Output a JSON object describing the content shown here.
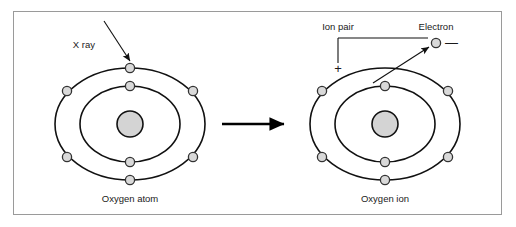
{
  "figure": {
    "border_color": "#9a9a9a",
    "background_color": "#ffffff"
  },
  "labels": {
    "xray": "X ray",
    "ion_pair": "Ion pair",
    "electron": "Electron",
    "plus_sign": "+",
    "minus_sign": "—",
    "caption_left": "Oxygen atom",
    "caption_right": "Oxygen ion"
  },
  "colors": {
    "nucleus_fill": "#d4d4d4",
    "electron_fill": "#d9d9d9",
    "stroke": "#111111",
    "text": "#1a1a1a"
  },
  "atoms": [
    {
      "id": "oxygen-atom",
      "caption": "Oxygen atom",
      "center": {
        "cx": 130,
        "cy": 124
      },
      "nucleus": {
        "cx": 130,
        "cy": 124,
        "r": 13
      },
      "shells": [
        {
          "name": "inner-shell",
          "rx": 50,
          "ry": 38
        },
        {
          "name": "outer-shell",
          "rx": 75,
          "ry": 56
        }
      ],
      "electron_count_outer": 6,
      "electron_count_inner": 2,
      "electrons": [
        {
          "name": "outer-electron-top",
          "shell": "outer",
          "cx": 130,
          "cy": 68,
          "r": 4.6
        },
        {
          "name": "outer-electron-top-left",
          "shell": "outer",
          "cx": 67,
          "cy": 91,
          "r": 4.6
        },
        {
          "name": "outer-electron-top-right",
          "shell": "outer",
          "cx": 193,
          "cy": 91,
          "r": 4.6
        },
        {
          "name": "outer-electron-bottom-left",
          "shell": "outer",
          "cx": 67,
          "cy": 157,
          "r": 4.6
        },
        {
          "name": "outer-electron-bottom-right",
          "shell": "outer",
          "cx": 193,
          "cy": 157,
          "r": 4.6
        },
        {
          "name": "outer-electron-bottom",
          "shell": "outer",
          "cx": 130,
          "cy": 180,
          "r": 4.6
        },
        {
          "name": "inner-electron-top",
          "shell": "inner",
          "cx": 130,
          "cy": 86,
          "r": 4.6
        },
        {
          "name": "inner-electron-bottom",
          "shell": "inner",
          "cx": 130,
          "cy": 162,
          "r": 4.6
        }
      ]
    },
    {
      "id": "oxygen-ion",
      "caption": "Oxygen ion",
      "center": {
        "cx": 385,
        "cy": 124
      },
      "nucleus": {
        "cx": 385,
        "cy": 124,
        "r": 13
      },
      "shells": [
        {
          "name": "inner-shell",
          "rx": 50,
          "ry": 38
        },
        {
          "name": "outer-shell",
          "rx": 75,
          "ry": 56
        }
      ],
      "electron_count_outer": 5,
      "electron_count_inner": 2,
      "electrons": [
        {
          "name": "outer-electron-top-left",
          "shell": "outer",
          "cx": 322,
          "cy": 91,
          "r": 4.6
        },
        {
          "name": "outer-electron-top-right",
          "shell": "outer",
          "cx": 448,
          "cy": 91,
          "r": 4.6
        },
        {
          "name": "outer-electron-bottom-left",
          "shell": "outer",
          "cx": 322,
          "cy": 157,
          "r": 4.6
        },
        {
          "name": "outer-electron-bottom-right",
          "shell": "outer",
          "cx": 448,
          "cy": 157,
          "r": 4.6
        },
        {
          "name": "outer-electron-bottom",
          "shell": "outer",
          "cx": 385,
          "cy": 180,
          "r": 4.6
        },
        {
          "name": "inner-electron-top",
          "shell": "inner",
          "cx": 385,
          "cy": 86,
          "r": 4.6
        },
        {
          "name": "inner-electron-bottom",
          "shell": "inner",
          "cx": 385,
          "cy": 162,
          "r": 4.6
        }
      ]
    }
  ],
  "free_electron": {
    "name": "ejected-electron",
    "cx": 436,
    "cy": 43,
    "r": 4.6,
    "charge": "—"
  },
  "transition_arrow": {
    "name": "reaction-arrow",
    "from_x": 222,
    "to_x": 287,
    "y": 124
  }
}
